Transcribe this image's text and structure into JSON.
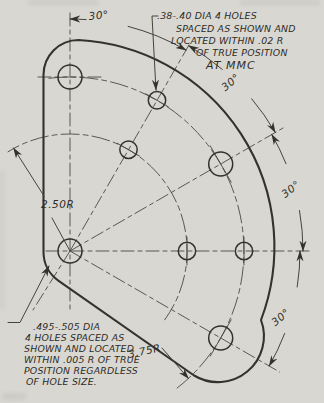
{
  "notes": {
    "top": [
      ".38-.40 DIA 4 HOLES",
      "SPACED AS SHOWN AND",
      "LOCATED WITHIN .02 R",
      "OF TRUE POSITION",
      "AT MMC"
    ],
    "bottom": [
      ".495-.505 DIA",
      "4 HOLES SPACED AS",
      "SHOWN AND LOCATED",
      "WITHIN .005 R OF TRUE",
      "POSITION REGARDLESS",
      "OF HOLE SIZE."
    ]
  },
  "dimensions": {
    "angles": [
      "30°",
      "30°",
      "30°",
      "30°"
    ],
    "inner_radius": "2.50R",
    "outer_radius": "3.75R"
  },
  "colors": {
    "paper": "#d9d7d2",
    "ink": "#34322c"
  }
}
